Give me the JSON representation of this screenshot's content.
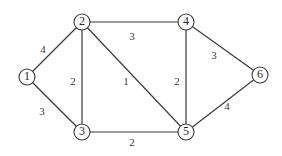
{
  "graph": {
    "nodes": [
      {
        "id": "1",
        "label": "1"
      },
      {
        "id": "2",
        "label": "2"
      },
      {
        "id": "3",
        "label": "3"
      },
      {
        "id": "4",
        "label": "4"
      },
      {
        "id": "5",
        "label": "5"
      },
      {
        "id": "6",
        "label": "6"
      }
    ],
    "edges": [
      {
        "from": "1",
        "to": "2",
        "weight": "4"
      },
      {
        "from": "1",
        "to": "3",
        "weight": "3"
      },
      {
        "from": "2",
        "to": "3",
        "weight": "2"
      },
      {
        "from": "2",
        "to": "4",
        "weight": "3"
      },
      {
        "from": "2",
        "to": "5",
        "weight": "1"
      },
      {
        "from": "3",
        "to": "5",
        "weight": "2"
      },
      {
        "from": "4",
        "to": "5",
        "weight": "2"
      },
      {
        "from": "4",
        "to": "6",
        "weight": "3"
      },
      {
        "from": "5",
        "to": "6",
        "weight": "4"
      }
    ]
  }
}
